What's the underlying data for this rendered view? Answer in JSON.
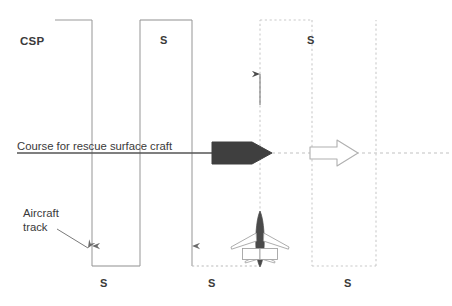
{
  "diagram": {
    "type": "search-pattern-diagram",
    "colors": {
      "solid_line": "#8c8c8c",
      "dotted_line": "#c9c9c9",
      "course_line": "#555555",
      "ship_fill": "#3f3f3f",
      "arrow_outline": "#b0b0b0",
      "aircraft_fill": "#4a4a4a",
      "text": "#3a3a3a",
      "background": "#ffffff"
    },
    "labels": {
      "csp": "CSP",
      "course_for_rescue_surface_craft": "Course for rescue surface craft",
      "aircraft_track": "Aircraft\ntrack",
      "aircraft_track_line1": "Aircraft",
      "aircraft_track_line2": "track",
      "leg_spacing_1": "S",
      "leg_spacing_2": "S",
      "leg_spacing_3": "S",
      "leg_spacing_4": "S",
      "leg_spacing_5": "S"
    },
    "icons": {
      "ship": "ship-symbol",
      "aircraft": "aircraft-symbol",
      "direction_arrow": "right-arrow-outline-icon",
      "track_up_arrow": "up-arrow-icon",
      "track_down_arrow_1": "down-arrow-icon",
      "track_down_arrow_2": "down-arrow-icon",
      "leader_arrow": "leader-arrow-icon"
    },
    "geometry": {
      "start_point_x": 55,
      "track_legs_solid": [
        92,
        140,
        192
      ],
      "track_legs_dotted": [
        260,
        312,
        376
      ],
      "top_y": 20,
      "bottom_y": 266,
      "course_line_y": 153,
      "course_line_x_start": 17,
      "course_line_x_end": 452
    }
  }
}
